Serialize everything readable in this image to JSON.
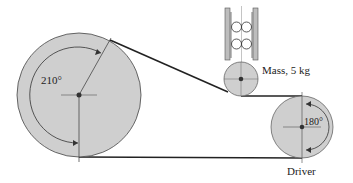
{
  "diagram": {
    "type": "belt-drive",
    "colors": {
      "pulley_fill": "#cfcfcf",
      "stroke": "#333333",
      "belt": "#222222",
      "rail": "#bdbdbd",
      "background": "#ffffff"
    },
    "labels": {
      "large_pulley_angle": "210°",
      "driver_angle": "180°",
      "idler_mass": "Mass, 5 kg",
      "driver": "Driver"
    },
    "components": [
      {
        "name": "large-pulley",
        "label": "",
        "wrap_angle_deg": 210
      },
      {
        "name": "idler-pulley",
        "label": "Mass, 5 kg"
      },
      {
        "name": "driver-pulley",
        "label": "Driver",
        "wrap_angle_deg": 180
      },
      {
        "name": "guide-rails-with-rollers",
        "label": ""
      }
    ]
  }
}
